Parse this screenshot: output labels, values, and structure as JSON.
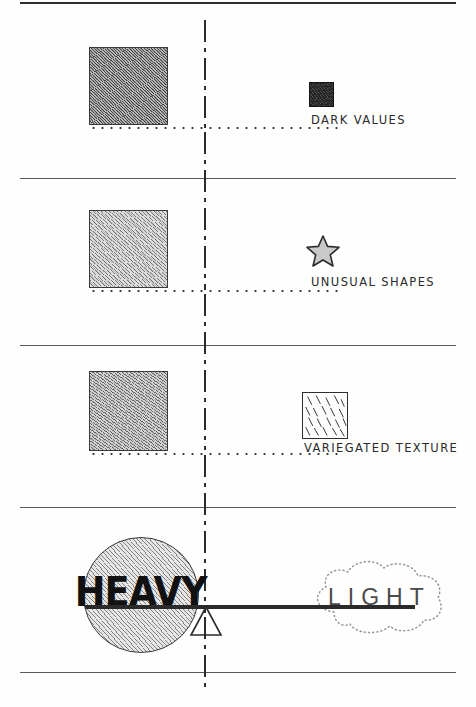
{
  "page": {
    "background_color": "#fefefe",
    "ink_color": "#2a2a2a"
  },
  "rows": [
    {
      "id": "dark-values",
      "swatch_description": "dense-diagonal-hatch-dark",
      "icon": "dark-square-icon",
      "label": "DARK VALUES"
    },
    {
      "id": "unusual-shapes",
      "swatch_description": "light-diagonal-hatch",
      "icon": "star-icon",
      "label": "UNUSUAL SHAPES"
    },
    {
      "id": "variegated-texture",
      "swatch_description": "medium-diagonal-hatch",
      "icon": "variegated-square-icon",
      "label": "VARIEGATED TEXTURE"
    }
  ],
  "balance": {
    "heavy_label": "HEAVY",
    "light_label": "LIGHT",
    "fulcrum": "triangle-fulcrum-icon",
    "beam": "balance-beam"
  },
  "guides": {
    "center_line": "vertical-center-dash-dot-line",
    "rule_count": 5,
    "dotted_baseline": "dotted-baseline"
  }
}
